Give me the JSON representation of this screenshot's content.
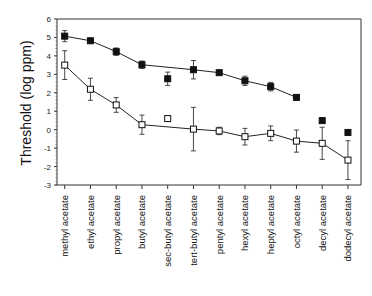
{
  "chart_data": {
    "type": "line",
    "title": "",
    "xlabel": "",
    "ylabel": "Threshold (log ppm)",
    "ylim": [
      -3,
      6
    ],
    "yticks": [
      6,
      5,
      4,
      3,
      2,
      1,
      0,
      -1,
      -2,
      -3
    ],
    "grid": false,
    "legend": null,
    "categories": [
      "methyl acetate",
      "ethyl acetate",
      "propyl acetate",
      "butyl acetate",
      "sec-butyl acetate",
      "tert-butyl acetate",
      "pentyl acetate",
      "hexyl acetate",
      "heptyl acetate",
      "octyl acetate",
      "decyl acetate",
      "dodecyl acetate"
    ],
    "series": [
      {
        "name": "filled squares",
        "marker": "filled-square",
        "values": [
          5.07,
          4.82,
          4.23,
          3.52,
          2.76,
          3.25,
          3.09,
          2.65,
          2.33,
          1.75,
          0.49,
          -0.15
        ],
        "errors": [
          0.3,
          0,
          0.2,
          0.2,
          0.36,
          0.5,
          0,
          0.25,
          0.23,
          0,
          0,
          0
        ],
        "connected": [
          true,
          true,
          true,
          true,
          false,
          true,
          true,
          true,
          true,
          true,
          false,
          false
        ]
      },
      {
        "name": "open squares",
        "marker": "open-square",
        "values": [
          3.5,
          2.19,
          1.34,
          0.27,
          0.6,
          0.03,
          -0.07,
          -0.38,
          -0.2,
          -0.62,
          -0.74,
          -1.65
        ],
        "errors": [
          0.78,
          0.6,
          0.4,
          0.52,
          0.15,
          1.18,
          0.2,
          0.45,
          0.4,
          0.6,
          0.87,
          1.05
        ],
        "connected": [
          true,
          true,
          true,
          true,
          false,
          true,
          true,
          true,
          true,
          true,
          true,
          true
        ]
      }
    ]
  }
}
